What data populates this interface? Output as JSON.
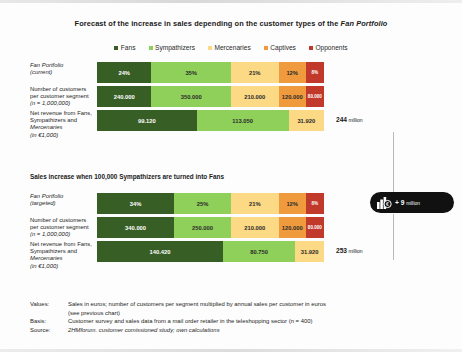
{
  "title_prefix": "Forecast of the increase in sales depending on the customer types of the ",
  "title_italic": "Fan Portfolio",
  "legend": [
    {
      "label": "Fans",
      "color": "#375e24"
    },
    {
      "label": "Sympathizers",
      "color": "#8fd05a"
    },
    {
      "label": "Mercenaries",
      "color": "#fbd985"
    },
    {
      "label": "Captives",
      "color": "#ef9a3c"
    },
    {
      "label": "Opponents",
      "color": "#c0392b"
    }
  ],
  "section1": {
    "rows": [
      {
        "label_line1": "Fan Portfolio",
        "label_line2": "(current)",
        "segments": [
          {
            "value": "24%",
            "pct": 24,
            "color": "#375e24",
            "text": "light"
          },
          {
            "value": "35%",
            "pct": 35,
            "color": "#8fd05a",
            "text": "dark"
          },
          {
            "value": "21%",
            "pct": 21,
            "color": "#fbd985",
            "text": "dark"
          },
          {
            "value": "12%",
            "pct": 12,
            "color": "#ef9a3c",
            "text": "dark"
          },
          {
            "value": "8%",
            "pct": 8,
            "color": "#c0392b",
            "text": "light"
          }
        ]
      },
      {
        "label_line1": "Number of customers",
        "label_line2": "per customer segment",
        "label_line3": "(n = 1,000,000)",
        "segments": [
          {
            "value": "240.000",
            "pct": 24,
            "color": "#375e24",
            "text": "light"
          },
          {
            "value": "350.000",
            "pct": 35,
            "color": "#8fd05a",
            "text": "dark"
          },
          {
            "value": "210.000",
            "pct": 21,
            "color": "#fbd985",
            "text": "dark"
          },
          {
            "value": "120.000",
            "pct": 12,
            "color": "#ef9a3c",
            "text": "dark"
          },
          {
            "value": "80.000",
            "pct": 8,
            "color": "#c0392b",
            "text": "light"
          }
        ]
      },
      {
        "label_line1": "Net revenue from Fans,",
        "label_line2": "Sympathizers and",
        "label_line3": "Mercenaries",
        "label_line4": "(in €1,000)",
        "total": "244",
        "total_unit": "million",
        "segments": [
          {
            "value": "99.120",
            "pct": 43.9,
            "color": "#375e24",
            "text": "light"
          },
          {
            "value": "113.050",
            "pct": 40.5,
            "color": "#8fd05a",
            "text": "dark"
          },
          {
            "value": "31.920",
            "pct": 15.6,
            "color": "#fbd985",
            "text": "dark"
          }
        ]
      }
    ]
  },
  "section2_heading": "Sales increase when 100,000 Sympathizers are turned into Fans",
  "section2": {
    "rows": [
      {
        "label_line1": "Fan Portfolio",
        "label_line2": "(targeted)",
        "segments": [
          {
            "value": "34%",
            "pct": 34,
            "color": "#375e24",
            "text": "light"
          },
          {
            "value": "25%",
            "pct": 25,
            "color": "#8fd05a",
            "text": "dark"
          },
          {
            "value": "21%",
            "pct": 21,
            "color": "#fbd985",
            "text": "dark"
          },
          {
            "value": "12%",
            "pct": 12,
            "color": "#ef9a3c",
            "text": "dark"
          },
          {
            "value": "8%",
            "pct": 8,
            "color": "#c0392b",
            "text": "light"
          }
        ]
      },
      {
        "label_line1": "Number of customers",
        "label_line2": "per customer segment",
        "label_line3": "(n = 1,000,000)",
        "segments": [
          {
            "value": "340.000",
            "pct": 34,
            "color": "#375e24",
            "text": "light"
          },
          {
            "value": "250.000",
            "pct": 25,
            "color": "#8fd05a",
            "text": "dark"
          },
          {
            "value": "210.000",
            "pct": 21,
            "color": "#fbd985",
            "text": "dark"
          },
          {
            "value": "120.000",
            "pct": 12,
            "color": "#ef9a3c",
            "text": "dark"
          },
          {
            "value": "80.000",
            "pct": 8,
            "color": "#c0392b",
            "text": "light"
          }
        ]
      },
      {
        "label_line1": "Net revenue from Fans,",
        "label_line2": "Sympathizers and",
        "label_line3": "Mercenaries",
        "label_line4": "(in €1,000)",
        "total": "253",
        "total_unit": "million",
        "segments": [
          {
            "value": "140.420",
            "pct": 55.5,
            "color": "#375e24",
            "text": "light"
          },
          {
            "value": "80.750",
            "pct": 31.9,
            "color": "#8fd05a",
            "text": "dark"
          },
          {
            "value": "31.920",
            "pct": 12.6,
            "color": "#fbd985",
            "text": "dark"
          }
        ]
      }
    ]
  },
  "badge": {
    "icon": "bar-chart-euro-icon",
    "text": "+ 9",
    "unit": "million"
  },
  "footer": {
    "values_key": "Values:",
    "values_text": "Sales in euros; number of customers per segment multiplied by annual sales per customer in euros",
    "values_text2": "(see previous chart)",
    "basis_key": "Basis:",
    "basis_text": "Customer survey and sales data from a mail order retailer in the teleshopping sector (n = 400)",
    "source_key": "Source:",
    "source_text": "2HMforum. customer comissioned study; own calculations"
  },
  "chart_data": {
    "type": "bar",
    "title": "Forecast of the increase in sales depending on the customer types of the Fan Portfolio",
    "orientation": "horizontal-stacked",
    "legend_position": "top-center",
    "categories": [
      "Fans",
      "Sympathizers",
      "Mercenaries",
      "Captives",
      "Opponents"
    ],
    "panels": [
      {
        "name": "Fan Portfolio (current)",
        "series": [
          {
            "name": "Fan Portfolio (current) share %",
            "unit": "%",
            "values": [
              24,
              35,
              21,
              12,
              8
            ]
          },
          {
            "name": "Number of customers per customer segment (n = 1,000,000)",
            "unit": "customers",
            "values": [
              240000,
              350000,
              210000,
              120000,
              80000
            ]
          },
          {
            "name": "Net revenue from Fans, Sympathizers and Mercenaries (in €1,000)",
            "unit": "€1,000",
            "categories": [
              "Fans",
              "Sympathizers",
              "Mercenaries"
            ],
            "values": [
              99120,
              113050,
              31920
            ],
            "total": 244,
            "total_unit": "million"
          }
        ]
      },
      {
        "name": "Sales increase when 100,000 Sympathizers are turned into Fans",
        "series": [
          {
            "name": "Fan Portfolio (targeted) share %",
            "unit": "%",
            "values": [
              34,
              25,
              21,
              12,
              8
            ]
          },
          {
            "name": "Number of customers per customer segment (n = 1,000,000)",
            "unit": "customers",
            "values": [
              340000,
              250000,
              210000,
              120000,
              80000
            ]
          },
          {
            "name": "Net revenue from Fans, Sympathizers and Mercenaries (in €1,000)",
            "unit": "€1,000",
            "categories": [
              "Fans",
              "Sympathizers",
              "Mercenaries"
            ],
            "values": [
              140420,
              80750,
              31920
            ],
            "total": 253,
            "total_unit": "million"
          }
        ]
      }
    ],
    "annotation": "+ 9 million",
    "colors": {
      "fans": "#375e24",
      "sympathizers": "#8fd05a",
      "mercenaries": "#fbd985",
      "captives": "#ef9a3c",
      "opponents": "#c0392b"
    }
  }
}
